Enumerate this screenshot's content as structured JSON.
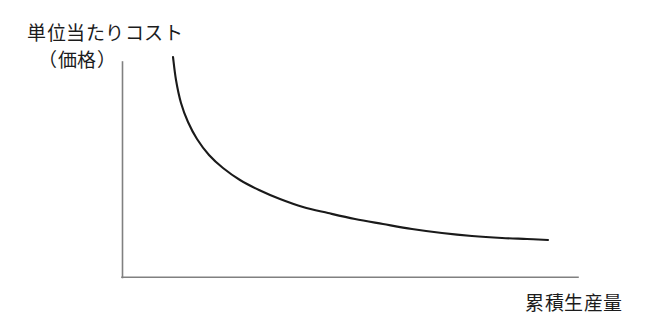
{
  "figure": {
    "kind": "line-diagram",
    "background_color": "#ffffff"
  },
  "labels": {
    "y_axis_line1": "単位当たりコスト",
    "y_axis_line2": "（価格）",
    "x_axis": "累積生産量"
  },
  "colors": {
    "axis": "#808080",
    "curve": "#1a1a1a",
    "text": "#1c1c1c",
    "background": "#ffffff"
  },
  "chart_data": {
    "type": "line",
    "title": "",
    "subtitle": "",
    "xlabel": "累積生産量",
    "ylabel": "単位当たりコスト（価格）",
    "grid": false,
    "legend": null,
    "annotations": [],
    "tick_labels": {
      "x": [],
      "y": []
    },
    "axis_pixels": {
      "y_axis_x": 122,
      "y_axis_top_y": 62,
      "origin_y": 277,
      "x_axis_right_x": 578
    },
    "xlim": [
      0,
      1
    ],
    "ylim": [
      0,
      1
    ],
    "series": [
      {
        "name": "unit-cost-experience-curve",
        "shape": "decreasing-convex-hyperbolic",
        "points_px": [
          [
            173,
            57
          ],
          [
            176,
            80
          ],
          [
            181,
            103
          ],
          [
            188,
            122
          ],
          [
            197,
            139
          ],
          [
            209,
            155
          ],
          [
            223,
            168
          ],
          [
            240,
            180
          ],
          [
            259,
            190
          ],
          [
            280,
            199
          ],
          [
            303,
            207
          ],
          [
            328,
            213
          ],
          [
            355,
            219
          ],
          [
            383,
            224
          ],
          [
            412,
            229
          ],
          [
            442,
            233
          ],
          [
            472,
            236
          ],
          [
            502,
            238
          ],
          [
            527,
            239
          ],
          [
            548,
            240
          ]
        ],
        "x": [
          0.0,
          0.05,
          0.1,
          0.15,
          0.2,
          0.25,
          0.3,
          0.35,
          0.4,
          0.45,
          0.5,
          0.55,
          0.6,
          0.65,
          0.7,
          0.75,
          0.8,
          0.85,
          0.9,
          0.95
        ],
        "values": [
          1.0,
          0.9,
          0.79,
          0.72,
          0.64,
          0.57,
          0.51,
          0.45,
          0.4,
          0.36,
          0.32,
          0.29,
          0.27,
          0.25,
          0.22,
          0.2,
          0.19,
          0.18,
          0.175,
          0.17
        ]
      }
    ]
  }
}
